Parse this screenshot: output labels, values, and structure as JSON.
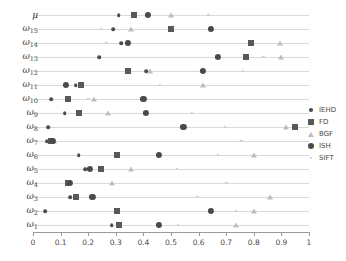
{
  "chart_data": {
    "type": "scatter",
    "title": "",
    "xlabel": "",
    "ylabel": "",
    "xlim": [
      0,
      1
    ],
    "grid": true,
    "legend_position": "right",
    "xticks": [
      "0",
      "0.1",
      "0.2",
      "0.3",
      "0.4",
      "0.5",
      "0.6",
      "0.7",
      "0.8",
      "0.9",
      "1"
    ],
    "xtick_values": [
      0,
      0.1,
      0.2,
      0.3,
      0.4,
      0.5,
      0.6,
      0.7,
      0.8,
      0.9,
      1
    ],
    "categories": [
      "μ",
      "ω₁₅",
      "ω₁₄",
      "ω₁₃",
      "ω₁₂",
      "ω₁₁",
      "ω₁₀",
      "ω₉",
      "ω₈",
      "ω₇",
      "ω₆",
      "ω₅",
      "ω₄",
      "ω₃",
      "ω₂",
      "ω₁"
    ],
    "category_bases": [
      "μ",
      "ω",
      "ω",
      "ω",
      "ω",
      "ω",
      "ω",
      "ω",
      "ω",
      "ω",
      "ω",
      "ω",
      "ω",
      "ω",
      "ω",
      "ω"
    ],
    "category_subs": [
      "",
      "15",
      "14",
      "13",
      "12",
      "11",
      "10",
      "9",
      "8",
      "7",
      "6",
      "5",
      "4",
      "3",
      "2",
      "1"
    ],
    "series": [
      {
        "name": "IEHD",
        "marker": "small-dot",
        "color": "#4d4d4d",
        "values": [
          0.31,
          0.29,
          0.32,
          0.24,
          0.41,
          0.155,
          0.065,
          0.115,
          0.055,
          0.05,
          0.165,
          0.19,
          0.13,
          0.135,
          0.045,
          0.285
        ]
      },
      {
        "name": "FD",
        "marker": "square",
        "color": "#595959",
        "values": [
          0.365,
          0.5,
          0.79,
          0.77,
          0.345,
          0.175,
          0.125,
          0.165,
          0.95,
          0.065,
          0.305,
          0.245,
          0.125,
          0.155,
          0.305,
          0.31
        ]
      },
      {
        "name": "BGF",
        "marker": "triangle",
        "color": "#bdbdbd",
        "values": [
          0.5,
          0.355,
          0.895,
          0.9,
          0.425,
          0.615,
          0.22,
          0.27,
          0.915,
          0.075,
          0.8,
          0.355,
          0.285,
          0.86,
          0.8,
          0.735
        ]
      },
      {
        "name": "ISH",
        "marker": "large-dot",
        "color": "#4a4a4a",
        "values": [
          0.415,
          0.645,
          0.345,
          0.67,
          0.615,
          0.12,
          0.4,
          0.41,
          0.545,
          0.07,
          0.455,
          0.205,
          0.135,
          0.215,
          0.645,
          0.455
        ]
      },
      {
        "name": "SIFT",
        "marker": "tiny-dot",
        "color": "#cfcfcf",
        "values": [
          0.635,
          0.245,
          0.265,
          0.835,
          0.76,
          0.46,
          0.2,
          0.575,
          0.695,
          0.755,
          0.67,
          0.52,
          0.7,
          0.595,
          0.735,
          0.525
        ]
      }
    ]
  },
  "legend": {
    "items": [
      {
        "label": "IEHD",
        "marker": "small-dot"
      },
      {
        "label": "FD",
        "marker": "square"
      },
      {
        "label": "BGF",
        "marker": "triangle"
      },
      {
        "label": "ISH",
        "marker": "large-dot"
      },
      {
        "label": "SIFT",
        "marker": "tiny-dot"
      }
    ]
  }
}
